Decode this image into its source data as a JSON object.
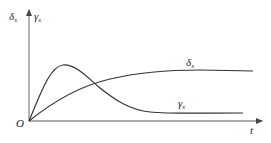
{
  "diagram": {
    "y_axis_label_left": "δ",
    "y_axis_label_left_sub": "s",
    "y_axis_label_right": "γ",
    "y_axis_label_right_sub": "s",
    "x_axis_label": "t",
    "origin_label": "O",
    "curves": [
      {
        "name": "delta_s",
        "label": "δ",
        "sub": "s",
        "description": "monotonically rising, saturating curve"
      },
      {
        "name": "gamma_s",
        "label": "γ",
        "sub": "s",
        "description": "rises to peak then decays to low plateau"
      }
    ],
    "colors": {
      "line": "#333333",
      "axis": "#555555",
      "background": "#ffffff"
    }
  }
}
